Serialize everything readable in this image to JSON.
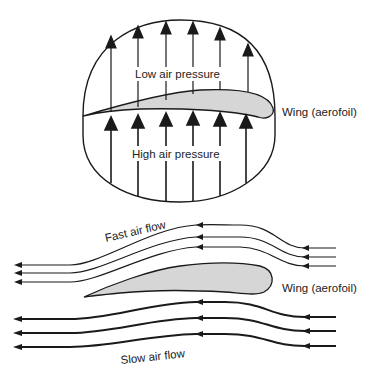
{
  "diagram": {
    "top_panel": {
      "label_low": "Low air pressure",
      "label_high": "High air pressure",
      "label_wing": "Wing (aerofoil)",
      "arrow_count_top": 6,
      "arrow_count_bottom": 6
    },
    "bottom_panel": {
      "label_fast": "Fast air flow",
      "label_slow": "Slow air flow",
      "label_wing": "Wing (aerofoil)",
      "fast_line_count": 3,
      "slow_line_count": 3
    },
    "colors": {
      "ink": "#1a1a1a",
      "wing_fill": "#d6d6d6",
      "background": "#ffffff"
    }
  }
}
